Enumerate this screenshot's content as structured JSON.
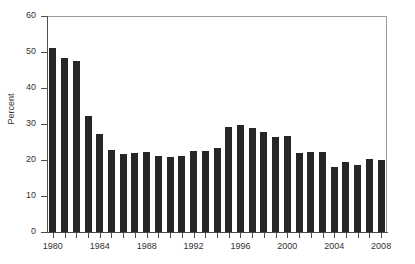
{
  "chart_data": {
    "type": "bar",
    "title": "",
    "xlabel": "",
    "ylabel": "Percent",
    "ylim": [
      0,
      60
    ],
    "ytick_values": [
      0,
      10,
      20,
      30,
      40,
      50,
      60
    ],
    "ytick_labels": [
      "0",
      "10",
      "20",
      "30",
      "40",
      "50",
      "60"
    ],
    "xlim": [
      1979.5,
      2008.5
    ],
    "xtick_labels": [
      "1980",
      "1984",
      "1988",
      "1992",
      "1996",
      "2000",
      "2004",
      "2008"
    ],
    "grid": false,
    "legend": null,
    "bar_color": "#262626",
    "axis_color": "#4d4d4d",
    "frame_color": "#9a9a9a",
    "categories": [
      "1980",
      "1981",
      "1982",
      "1983",
      "1984",
      "1985",
      "1986",
      "1987",
      "1988",
      "1989",
      "1990",
      "1991",
      "1992",
      "1993",
      "1994",
      "1995",
      "1996",
      "1997",
      "1998",
      "1999",
      "2000",
      "2001",
      "2002",
      "2003",
      "2004",
      "2005",
      "2006",
      "2007",
      "2008"
    ],
    "values": [
      51.0,
      48.2,
      47.6,
      32.2,
      27.3,
      22.9,
      21.8,
      22.0,
      22.3,
      21.2,
      20.8,
      21.0,
      22.4,
      22.5,
      23.2,
      29.2,
      29.6,
      29.0,
      27.7,
      26.4,
      26.7,
      22.0,
      22.3,
      22.1,
      18.1,
      19.4,
      18.7,
      20.2,
      19.9
    ],
    "n_bars": 29
  },
  "axis": {
    "y_title": "Percent"
  }
}
